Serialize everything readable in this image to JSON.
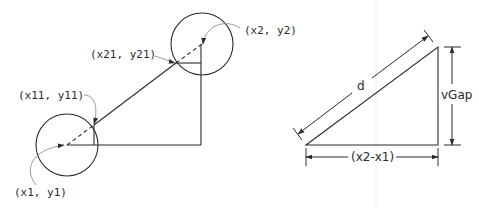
{
  "diagram": {
    "left_panel": {
      "labels": {
        "p1": "(x1, y1)",
        "p2": "(x2, y2)",
        "p11": "(x11, y11)",
        "p21": "(x21, y21)"
      },
      "circle1": {
        "cx": 67,
        "cy": 145,
        "r": 31
      },
      "circle2": {
        "cx": 202,
        "cy": 44,
        "r": 31
      }
    },
    "right_panel": {
      "labels": {
        "hypotenuse": "d",
        "vertical": "vGap",
        "horizontal": "(x2-x1)"
      }
    }
  },
  "colors": {
    "line": "#2b2b2b",
    "leader": "#9a9a9a",
    "background": "#ffffff"
  }
}
